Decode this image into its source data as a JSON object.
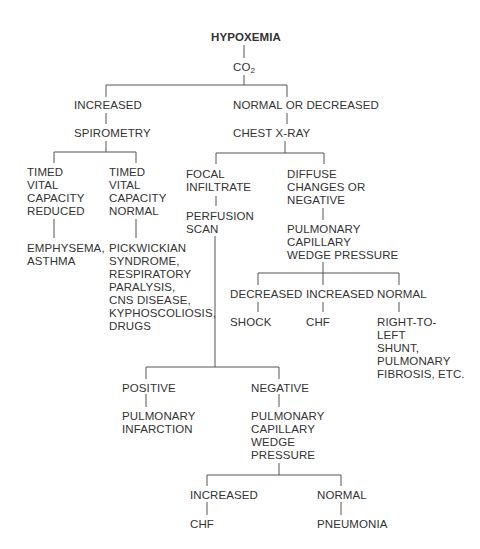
{
  "title": "HYPOXEMIA",
  "nodes": {
    "co2": {
      "main": "CO",
      "sub": "2"
    },
    "increased": "INCREASED",
    "normal_or_decreased": "NORMAL OR DECREASED",
    "spirometry": "SPIROMETRY",
    "chest_xray": "CHEST X-RAY",
    "tvc_reduced": [
      "TIMED",
      "VITAL",
      "CAPACITY",
      "REDUCED"
    ],
    "tvc_normal": [
      "TIMED",
      "VITAL",
      "CAPACITY",
      "NORMAL"
    ],
    "emphysema": [
      "EMPHYSEMA,",
      "ASTHMA"
    ],
    "pickwickian": [
      "PICKWICKIAN",
      "SYNDROME,",
      "RESPIRATORY",
      "PARALYSIS,",
      "CNS DISEASE,",
      "KYPHOSCOLIOSIS,",
      "DRUGS"
    ],
    "focal_infiltrate": [
      "FOCAL",
      "INFILTRATE"
    ],
    "perfusion_scan": [
      "PERFUSION",
      "SCAN"
    ],
    "diffuse": [
      "DIFFUSE",
      "CHANGES OR",
      "NEGATIVE"
    ],
    "pcwp1": [
      "PULMONARY",
      "CAPILLARY",
      "WEDGE PRESSURE"
    ],
    "pcwp1_decreased": "DECREASED",
    "pcwp1_increased": "INCREASED",
    "pcwp1_normal": "NORMAL",
    "shock": "SHOCK",
    "chf1": "CHF",
    "shunt": [
      "RIGHT-TO-",
      "LEFT",
      "SHUNT,",
      "PULMONARY",
      "FIBROSIS, ETC."
    ],
    "positive": "POSITIVE",
    "negative": "NEGATIVE",
    "pulm_infarction": [
      "PULMONARY",
      "INFARCTION"
    ],
    "pcwp2": [
      "PULMONARY",
      "CAPILLARY",
      "WEDGE",
      "PRESSURE"
    ],
    "pcwp2_increased": "INCREASED",
    "pcwp2_normal": "NORMAL",
    "chf2": "CHF",
    "pneumonia": "PNEUMONIA"
  }
}
